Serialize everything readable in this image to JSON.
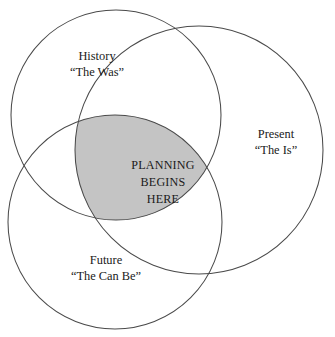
{
  "diagram": {
    "type": "venn-3-circle",
    "background_color": "#ffffff",
    "stroke_color": "#4a4a4a",
    "intersection_fill_color": "#c4c4c4",
    "text_color": "#1a1a1a",
    "sets": [
      {
        "id": "history",
        "name": "History",
        "label_line1": "History",
        "label_line2": "“The Was”",
        "position": "top-left",
        "center_x": 116,
        "center_y": 115,
        "radius": 105,
        "label_x": 97,
        "label_y": 60
      },
      {
        "id": "present",
        "name": "Present",
        "label_line1": "Present",
        "label_line2": "“The Is”",
        "position": "right",
        "center_x": 199,
        "center_y": 150,
        "radius": 124,
        "label_x": 276,
        "label_y": 138
      },
      {
        "id": "future",
        "name": "Future",
        "label_line1": "Future",
        "label_line2": "“The Can Be”",
        "position": "bottom-left",
        "center_x": 115,
        "center_y": 222,
        "radius": 107,
        "label_x": 106,
        "label_y": 264
      }
    ],
    "intersection": {
      "id": "triple-intersection",
      "label_line1": "PLANNING",
      "label_line2": "BEGINS",
      "label_line3": "HERE",
      "label_x": 163,
      "label_y": 169,
      "fill_color": "#c4c4c4",
      "members": [
        "History",
        "Present",
        "Future"
      ]
    }
  }
}
